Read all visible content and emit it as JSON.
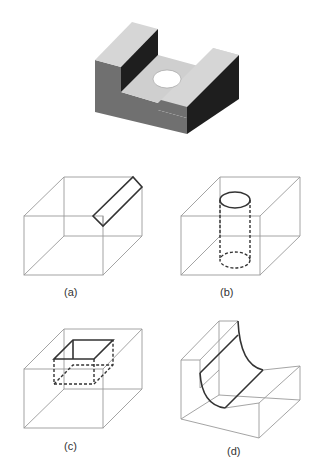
{
  "figure": {
    "main_part": {
      "description": "Shaded isometric block with U-shaped slot and through-hole",
      "colors": {
        "top_face": "#d2d2d2",
        "front_face": "#707070",
        "side_face": "#1e1e1e",
        "hole": "#ffffff"
      }
    },
    "panels": [
      {
        "id": "a",
        "label": "(a)",
        "feature": "diagonal slot on top-right edge"
      },
      {
        "id": "b",
        "label": "(b)",
        "feature": "cylindrical hole (hidden lines dashed)"
      },
      {
        "id": "c",
        "label": "(c)",
        "feature": "rectangular pocket (hidden lines dashed)"
      },
      {
        "id": "d",
        "label": "(d)",
        "feature": "step with filleted inner corner"
      }
    ],
    "colors": {
      "thin_line": "#9a9a9a",
      "bold_line": "#333333"
    }
  }
}
